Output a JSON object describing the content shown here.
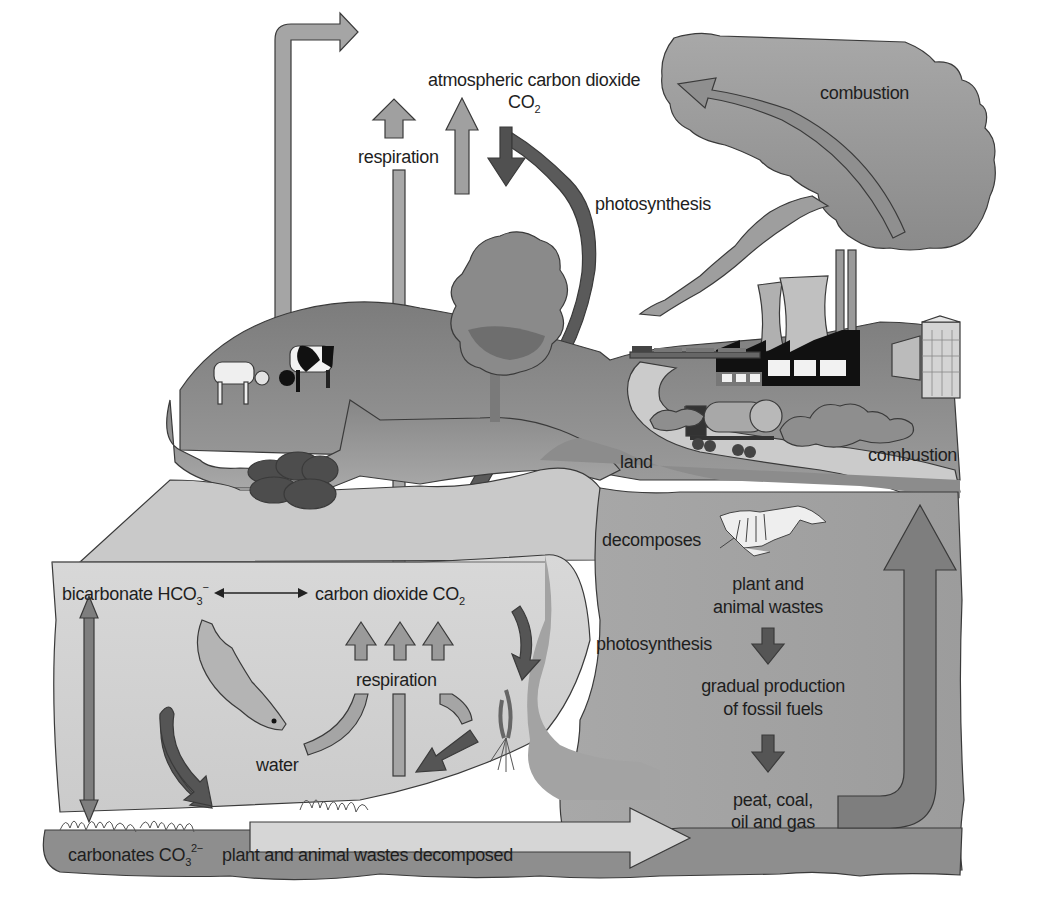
{
  "labels": {
    "atmospheric_co2_line1": "atmospheric carbon dioxide",
    "atmospheric_co2_formula": "CO",
    "atmospheric_co2_subscript": "2",
    "respiration_top": "respiration",
    "photosynthesis_top": "photosynthesis",
    "combustion_cloud": "combustion",
    "combustion_land": "combustion",
    "land": "land",
    "decomposes": "decomposes",
    "plant_animal_wastes_line1": "plant and",
    "plant_animal_wastes_line2": "animal wastes",
    "photosynthesis_water": "photosynthesis",
    "fossil_production_line1": "gradual production",
    "fossil_production_line2": "of fossil fuels",
    "fossil_fuels_line1": "peat, coal,",
    "fossil_fuels_line2": "oil and gas",
    "bicarbonate": "bicarbonate HCO",
    "bicarbonate_subscript": "3",
    "bicarbonate_charge": "−",
    "carbon_dioxide_water": "carbon dioxide CO",
    "carbon_dioxide_water_subscript": "2",
    "respiration_water": "respiration",
    "water": "water",
    "carbonates": "carbonates CO",
    "carbonates_subscript": "3",
    "carbonates_charge": "2−",
    "wastes_decomposed": "plant and animal wastes decomposed"
  },
  "colors": {
    "sky": "#ffffff",
    "cloud": "#9a9a9a",
    "hill": "#8c8c8c",
    "hill_dark": "#7a7a7a",
    "water": "#d2d2d2",
    "sediment": "#8e8e8e",
    "ground_right": "#a6a6a6",
    "arrow_light": "#a3a3a3",
    "arrow_mid": "#8a8a8a",
    "arrow_dark": "#555555",
    "road": "#c8c8c8",
    "factory": "#111111"
  },
  "icons": [
    "cow-white-icon",
    "cow-spotted-icon",
    "tree-icon",
    "power-station-icon",
    "factory-icon",
    "building-icon",
    "train-icon",
    "tanker-truck-icon",
    "coal-pile-icon",
    "fish-icon",
    "water-plant-icon",
    "animal-skeleton-icon",
    "smoke-cloud-icon"
  ]
}
